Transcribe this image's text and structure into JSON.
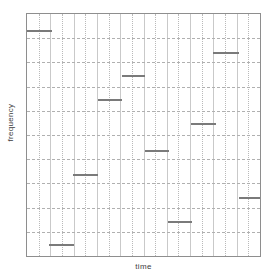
{
  "chart_data": {
    "type": "bar",
    "title": "",
    "subtitle": "",
    "xlabel": "time",
    "ylabel": "frequency",
    "xlim": [
      0,
      10
    ],
    "ylim": [
      0,
      10
    ],
    "grid": true,
    "legend": null,
    "annotations": [],
    "xticks": [
      0,
      1,
      2,
      3,
      4,
      5,
      6,
      7,
      8,
      9,
      10
    ],
    "yticks": [
      0,
      1,
      2,
      3,
      4,
      5,
      6,
      7,
      8,
      9,
      10
    ],
    "series": [
      {
        "name": "notes",
        "color": "#7a7a7a",
        "segments": [
          {
            "index": 1,
            "x_start": 0.0,
            "x_end": 1.09,
            "y": 9.35
          },
          {
            "index": 2,
            "x_start": 8.0,
            "x_end": 9.11,
            "y": 8.45
          },
          {
            "index": 3,
            "x_start": 4.09,
            "x_end": 5.06,
            "y": 7.47
          },
          {
            "index": 4,
            "x_start": 3.06,
            "x_end": 4.09,
            "y": 6.48
          },
          {
            "index": 5,
            "x_start": 7.02,
            "x_end": 8.09,
            "y": 5.49
          },
          {
            "index": 6,
            "x_start": 5.06,
            "x_end": 6.09,
            "y": 4.39
          },
          {
            "index": 7,
            "x_start": 1.96,
            "x_end": 3.02,
            "y": 3.4
          },
          {
            "index": 8,
            "x_start": 9.11,
            "x_end": 10.0,
            "y": 2.42
          },
          {
            "index": 9,
            "x_start": 6.04,
            "x_end": 7.06,
            "y": 1.43
          },
          {
            "index": 10,
            "x_start": 0.94,
            "x_end": 2.0,
            "y": 0.49
          }
        ]
      }
    ],
    "grid_major_x": [
      1,
      2,
      3,
      4,
      5,
      6,
      7,
      8,
      9
    ],
    "grid_minor_x": [
      0.5,
      1.5,
      2.5,
      3.5,
      4.5,
      5.5,
      6.5,
      7.5,
      8.5,
      9.5
    ],
    "grid_minor_y": [
      1,
      2,
      3,
      4,
      5,
      6,
      7,
      8,
      9
    ],
    "colors": {
      "note": "#7a7a7a",
      "frame": "#8e8e8e",
      "grid_major": "#c9c9c9",
      "grid_minor": "#b9b9b9",
      "grid_horizontal": "#b0b0b0",
      "background": "#ffffff",
      "label": "#3c3c3c"
    }
  }
}
